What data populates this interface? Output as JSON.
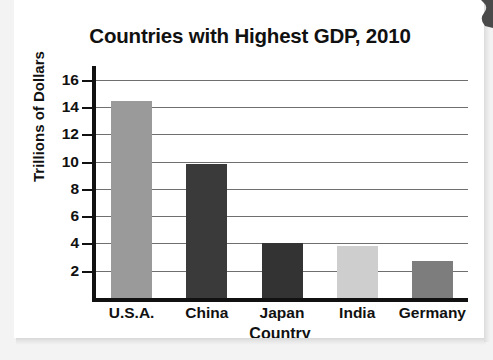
{
  "chart_data": {
    "type": "bar",
    "title": "Countries with Highest GDP, 2010",
    "xlabel": "Country",
    "ylabel": "Trillions of Dollars",
    "categories": [
      "U.S.A.",
      "China",
      "Japan",
      "India",
      "Germany"
    ],
    "values": [
      14.4,
      9.8,
      4.0,
      3.8,
      2.7
    ],
    "bar_colors": [
      "#9a9a9a",
      "#3a3a3a",
      "#333333",
      "#cecece",
      "#7d7d7d"
    ],
    "ylim": [
      0,
      17
    ],
    "yticks": [
      2,
      4,
      6,
      8,
      10,
      12,
      14,
      16
    ],
    "ytick_labels": [
      "2",
      "4",
      "6",
      "8",
      "10",
      "12",
      "14",
      "16"
    ],
    "grid": true,
    "legend": "none"
  }
}
